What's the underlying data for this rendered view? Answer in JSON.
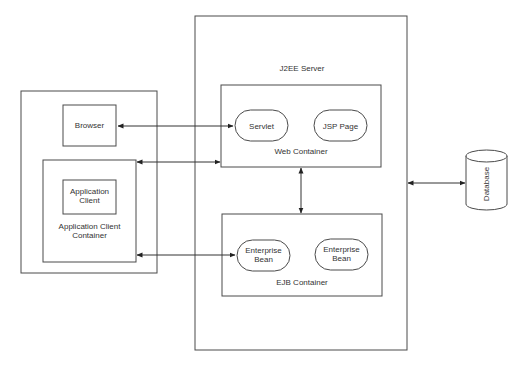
{
  "diagram": {
    "client_tier": {
      "browser": {
        "label": "Browser"
      },
      "app_client": {
        "label_line1": "Application",
        "label_line2": "Client"
      },
      "app_client_container": {
        "label_line1": "Application Client",
        "label_line2": "Container"
      }
    },
    "server": {
      "label": "J2EE Server",
      "web_container": {
        "label": "Web Container",
        "components": [
          {
            "label": "Servlet"
          },
          {
            "label": "JSP Page"
          }
        ]
      },
      "ejb_container": {
        "label": "EJB Container",
        "components": [
          {
            "label_line1": "Enterprise",
            "label_line2": "Bean"
          },
          {
            "label_line1": "Enterprise",
            "label_line2": "Bean"
          }
        ]
      }
    },
    "database": {
      "label": "Database"
    },
    "connections": [
      {
        "from": "Browser",
        "to": "Servlet",
        "type": "bidirectional"
      },
      {
        "from": "Application Client Container",
        "to": "Web Container",
        "type": "bidirectional"
      },
      {
        "from": "Application Client Container",
        "to": "Enterprise Bean",
        "type": "bidirectional"
      },
      {
        "from": "Web Container",
        "to": "EJB Container",
        "type": "bidirectional"
      },
      {
        "from": "J2EE Server",
        "to": "Database",
        "type": "bidirectional"
      }
    ]
  }
}
